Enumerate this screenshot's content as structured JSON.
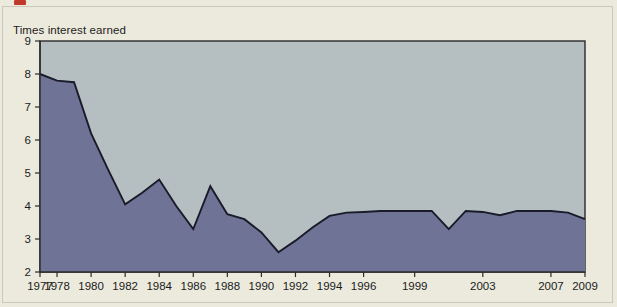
{
  "figure": {
    "marker_color": "#c0392b",
    "page_background": "#eceadd",
    "plot_background": "#b5bfc1",
    "area_fill": "#6f7497",
    "line_color": "#1a1a28",
    "axis_color": "#2a2a2a"
  },
  "chart_data": {
    "type": "area",
    "title": "",
    "ylabel": "Times interest earned",
    "xlabel": "",
    "ylim": [
      2,
      9
    ],
    "ytick_labels": [
      "9",
      "8",
      "7",
      "6",
      "5",
      "4",
      "3",
      "2"
    ],
    "ytick_values": [
      9,
      8,
      7,
      6,
      5,
      4,
      3,
      2
    ],
    "xtick_labels": [
      "1977",
      "1978",
      "1980",
      "1982",
      "1984",
      "1986",
      "1988",
      "1990",
      "1992",
      "1994",
      "1996",
      "1999",
      "2003",
      "2007",
      "2009"
    ],
    "grid": false,
    "legend": "none",
    "x": [
      1977,
      1978,
      1979,
      1980,
      1981,
      1982,
      1983,
      1984,
      1985,
      1986,
      1987,
      1988,
      1989,
      1990,
      1991,
      1992,
      1993,
      1994,
      1995,
      1996,
      1997,
      1998,
      1999,
      2000,
      2001,
      2002,
      2003,
      2004,
      2005,
      2006,
      2007,
      2008,
      2009
    ],
    "values": [
      8.0,
      7.8,
      7.75,
      6.2,
      5.1,
      4.05,
      4.4,
      4.8,
      4.0,
      3.3,
      4.6,
      3.75,
      3.6,
      3.2,
      2.6,
      2.95,
      3.35,
      3.7,
      3.8,
      3.82,
      3.85,
      3.85,
      3.85,
      3.85,
      3.3,
      3.85,
      3.82,
      3.72,
      3.85,
      3.85,
      3.85,
      3.8,
      3.6
    ],
    "series": [
      {
        "name": "Times interest earned",
        "values": [
          8.0,
          7.8,
          7.75,
          6.2,
          5.1,
          4.05,
          4.4,
          4.8,
          4.0,
          3.3,
          4.6,
          3.75,
          3.6,
          3.2,
          2.6,
          2.95,
          3.35,
          3.7,
          3.8,
          3.82,
          3.85,
          3.85,
          3.85,
          3.85,
          3.3,
          3.85,
          3.82,
          3.72,
          3.85,
          3.85,
          3.85,
          3.8,
          3.6
        ]
      }
    ],
    "xlim": [
      1977,
      2009
    ]
  }
}
